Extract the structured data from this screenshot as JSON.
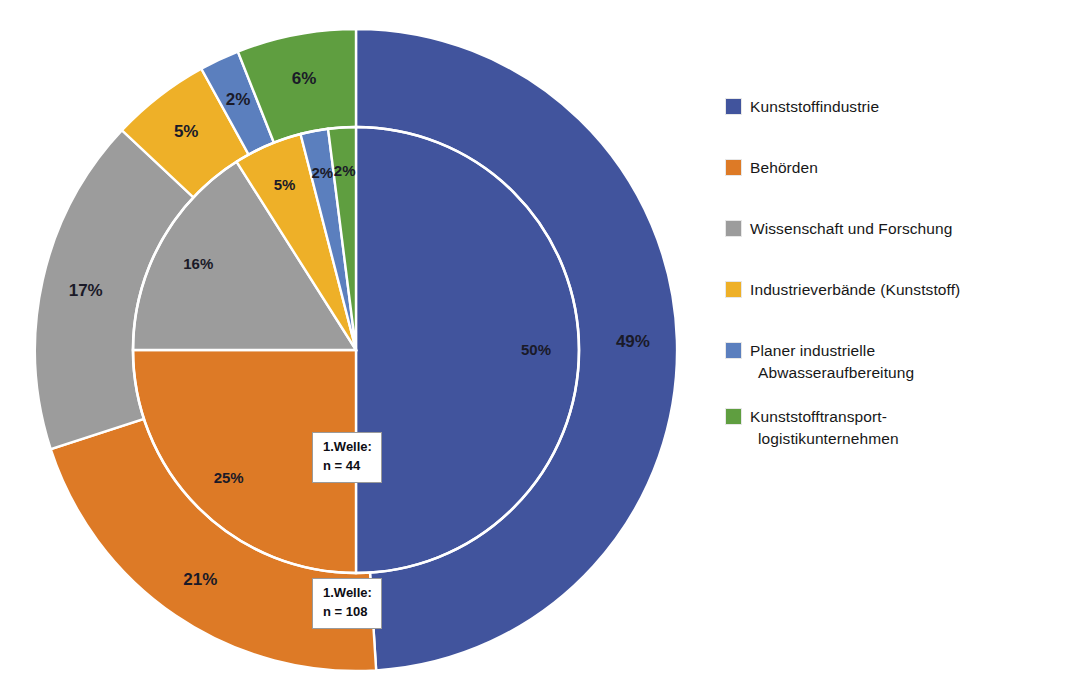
{
  "chart_data": {
    "type": "pie",
    "title": "",
    "subtitle": "",
    "xlabel": "",
    "ylabel": "",
    "legend_position": "right",
    "grid": false,
    "variant": "nested-donut-two-rings",
    "categories": [
      "Kunststoffindustrie",
      "Behörden",
      "Wissenschaft und Forschung",
      "Industrieverbände (Kunststoff)",
      "Planer industrielle Abwasseraufbereitung",
      "Kunststofftransport-logistikunternehmen"
    ],
    "colors": [
      "#41549d",
      "#dd7a26",
      "#9c9c9c",
      "#eeb028",
      "#5b7fbe",
      "#5f9e40"
    ],
    "series": [
      {
        "name": "1.Welle: n = 44",
        "ring": "inner",
        "n": 44,
        "values": [
          50,
          25,
          16,
          5,
          2,
          2
        ],
        "labels": [
          "50%",
          "25%",
          "16%",
          "5%",
          "2%",
          "2%"
        ]
      },
      {
        "name": "1.Welle: n = 108",
        "ring": "outer",
        "n": 108,
        "values": [
          49,
          21,
          17,
          5,
          2,
          6
        ],
        "labels": [
          "49%",
          "21%",
          "17%",
          "5%",
          "2%",
          "6%"
        ]
      }
    ]
  },
  "callouts": {
    "inner": {
      "line1": "1.Welle:",
      "line2": "n = 44"
    },
    "outer": {
      "line1": "1.Welle:",
      "line2": "n = 108"
    }
  },
  "legend": {
    "items": [
      {
        "label": "Kunststoffindustrie",
        "color": "#41549d",
        "line1": "Kunststoffindustrie",
        "line2": ""
      },
      {
        "label": "Behörden",
        "color": "#dd7a26",
        "line1": "Behörden",
        "line2": ""
      },
      {
        "label": "Wissenschaft und Forschung",
        "color": "#9c9c9c",
        "line1": "Wissenschaft und Forschung",
        "line2": ""
      },
      {
        "label": "Industrieverbände (Kunststoff)",
        "color": "#eeb028",
        "line1": "Industrieverbände (Kunststoff)",
        "line2": ""
      },
      {
        "label": "Planer industrielle Abwasseraufbereitung",
        "color": "#5b7fbe",
        "line1": "Planer industrielle",
        "line2": "Abwasseraufbereitung"
      },
      {
        "label": "Kunststofftransport-logistikunternehmen",
        "color": "#5f9e40",
        "line1": "Kunststofftransport-",
        "line2": "logistikunternehmen"
      }
    ]
  },
  "slice_labels": {
    "outer": {
      "kunststoffindustrie": "49%",
      "behoerden": "21%",
      "wissenschaft": "17%",
      "industrieverbaende": "5%",
      "planer": "2%",
      "logistik": "6%"
    },
    "inner": {
      "kunststoffindustrie": "50%",
      "behoerden": "25%",
      "wissenschaft": "16%",
      "industrieverbaende": "5%",
      "planer": "2%",
      "logistik": "2%"
    }
  }
}
